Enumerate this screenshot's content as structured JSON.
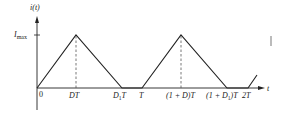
{
  "diagram": {
    "title": "",
    "y_axis_label": "i(t)",
    "x_axis_label": "t",
    "y_tick": "I_max",
    "y_tick_main": "I",
    "y_tick_sub": "max",
    "x_ticks": [
      "0",
      "DT",
      "D1T",
      "T",
      "(1 + D)T",
      "(1 + D1)T",
      "2T"
    ],
    "x_tick_labels": {
      "zero": "0",
      "dt": "DT",
      "d1t_main": "D",
      "d1t_sub": "1",
      "d1t_suffix": "T",
      "t": "T",
      "one_plus_d": "(1 + D)T",
      "one_plus_d1_prefix": "(1 + D",
      "one_plus_d1_sub": "1",
      "one_plus_d1_suffix": ")T",
      "two_t": "2T"
    },
    "waveform": "triangular current, discontinuous conduction",
    "colors": {
      "line": "#222222",
      "dashed": "#555555"
    }
  }
}
